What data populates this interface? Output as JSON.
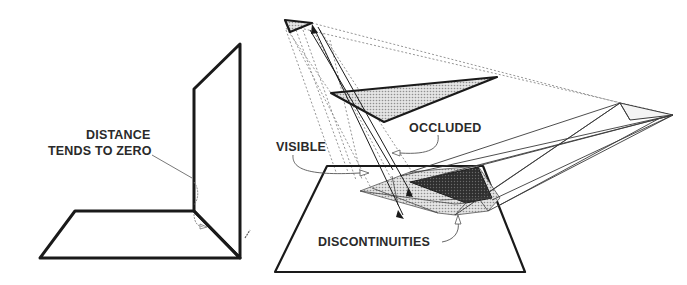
{
  "figure": {
    "left_panel": {
      "description": "Two planes meeting at a corner",
      "labels": {
        "line1": "DISTANCE",
        "line2": "TENDS TO ZERO"
      }
    },
    "right_panel": {
      "description": "Ray projection onto plane showing visible and occluded regions",
      "labels": {
        "occluded": "OCCLUDED",
        "visible": "VISIBLE",
        "discontinuities": "DISCONTINUITIES"
      }
    },
    "colors": {
      "stroke": "#1a1a1a",
      "light_fill": "#cfcfcf",
      "dark_fill": "#2b2b2b",
      "dashed": "#8a8a8a",
      "text": "#2a2a2a"
    }
  }
}
